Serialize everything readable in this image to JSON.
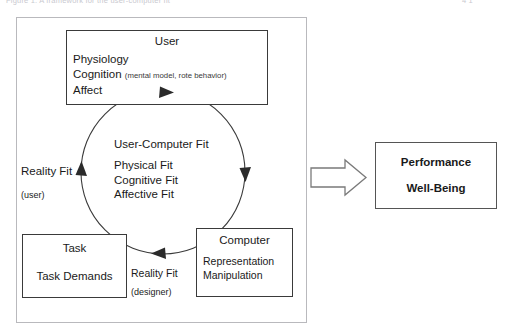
{
  "caption": {
    "left_text": "Figure 1. A framework for the user-computer fit",
    "right_text": "4  1"
  },
  "diagram": {
    "user_box": {
      "title": "User",
      "lines": [
        "Physiology",
        "Cognition",
        "Affect"
      ],
      "cognition_note": "(mental model, rote behavior)"
    },
    "circle": {
      "heading": "User-Computer Fit",
      "items": [
        "Physical Fit",
        "Cognitive Fit",
        "Affective Fit"
      ]
    },
    "task_box": {
      "title": "Task",
      "content": "Task Demands"
    },
    "computer_box": {
      "title": "Computer",
      "lines": [
        "Representation",
        "Manipulation"
      ]
    },
    "reality_fit_user": {
      "label": "Reality Fit",
      "qualifier": "(user)"
    },
    "reality_fit_designer": {
      "label": "Reality Fit",
      "qualifier": "(designer)"
    },
    "outcome_box": {
      "line1": "Performance",
      "line2": "Well-Being"
    },
    "flow_arrow": "block-arrow-right",
    "colors": {
      "box_border": "#3a3a3a",
      "frame_border": "#b9b9bd",
      "circle_stroke": "#3a3a3a",
      "text": "#1a1a1a",
      "background": "#ffffff"
    }
  }
}
